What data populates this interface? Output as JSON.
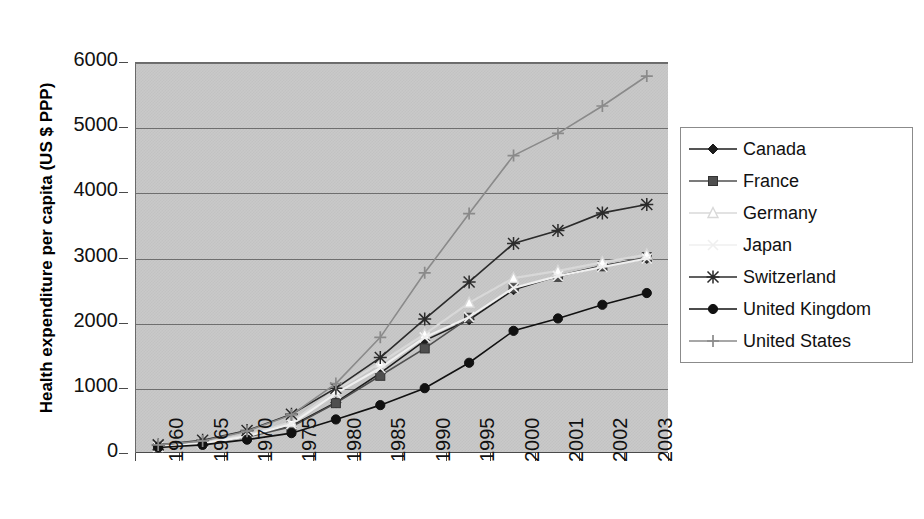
{
  "chart_data": {
    "type": "line",
    "title": "",
    "xlabel": "",
    "ylabel": "Health expenditure per capita (US $ PPP)",
    "categories": [
      "1960",
      "1965",
      "1970",
      "1975",
      "1980",
      "1985",
      "1990",
      "1995",
      "2000",
      "2001",
      "2002",
      "2003"
    ],
    "yticks": [
      "0",
      "1000",
      "2000",
      "3000",
      "4000",
      "5000",
      "6000"
    ],
    "ylim": [
      0,
      6000
    ],
    "grid": true,
    "legend_position": "right",
    "plot_background": "#c9c9c9",
    "series": [
      {
        "name": "Canada",
        "marker": "diamond",
        "color": "#1d1d1d",
        "values": [
          120,
          170,
          280,
          430,
          790,
          1240,
          1740,
          2060,
          2520,
          2730,
          2890,
          3000
        ]
      },
      {
        "name": "France",
        "marker": "square",
        "color": "#4f4f4f",
        "values": [
          110,
          160,
          260,
          420,
          780,
          1200,
          1620,
          2090,
          2550,
          2720,
          2880,
          3020
        ]
      },
      {
        "name": "Germany",
        "marker": "triangle-open",
        "color": "#d8d8d8",
        "values": [
          110,
          170,
          290,
          490,
          980,
          1400,
          1840,
          2320,
          2700,
          2810,
          2940,
          3060
        ]
      },
      {
        "name": "Japan",
        "marker": "x-light",
        "color": "#efefef",
        "values": [
          110,
          160,
          270,
          460,
          930,
          1320,
          1790,
          2100,
          2550,
          2730,
          2870,
          3000
        ]
      },
      {
        "name": "Switzerland",
        "marker": "asterisk",
        "color": "#2b2b2b",
        "values": [
          140,
          210,
          360,
          610,
          1010,
          1480,
          2070,
          2640,
          3230,
          3430,
          3700,
          3830
        ]
      },
      {
        "name": "United Kingdom",
        "marker": "circle",
        "color": "#111111",
        "values": [
          100,
          140,
          220,
          320,
          530,
          750,
          1010,
          1400,
          1890,
          2080,
          2290,
          2470
        ]
      },
      {
        "name": "United States",
        "marker": "plus",
        "color": "#8a8a8a",
        "values": [
          140,
          200,
          350,
          600,
          1080,
          1790,
          2780,
          3690,
          4580,
          4920,
          5340,
          5800
        ]
      }
    ]
  },
  "axis": {
    "y_title": "Health expenditure per capita (US $ PPP)"
  },
  "legend": {
    "items": [
      {
        "label": "Canada"
      },
      {
        "label": "France"
      },
      {
        "label": "Germany"
      },
      {
        "label": "Japan"
      },
      {
        "label": "Switzerland"
      },
      {
        "label": "United Kingdom"
      },
      {
        "label": "United States"
      }
    ]
  }
}
